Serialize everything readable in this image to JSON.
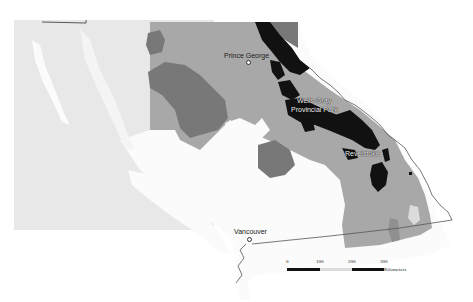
{
  "map": {
    "colors": {
      "ocean_background": "#e8e8e8",
      "land_white": "#fbfbfb",
      "zone_light_gray": "#a8a8a8",
      "zone_dark_gray": "#787878",
      "zone_black": "#111111",
      "zone_pale": "#dcdcdc",
      "border_line": "#555555"
    },
    "labels": {
      "prince_george": "Prince George",
      "wells_gray_line1": "Wells Gray",
      "wells_gray_line2": "Provincial Park",
      "revelstoke": "Revelstoke",
      "vancouver": "Vancouver"
    },
    "scale_bar": {
      "ticks": [
        "0",
        "100",
        "200",
        "300"
      ],
      "unit": "Kilometers"
    }
  }
}
